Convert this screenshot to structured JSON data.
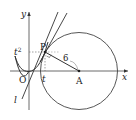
{
  "diagram": {
    "axes": {
      "x_label": "x",
      "y_label": "y",
      "origin_label": "O"
    },
    "points": {
      "P": "P",
      "A": "A"
    },
    "labels": {
      "t_squared": "t",
      "t_squared_exp": "2",
      "t": "t",
      "radius": "6",
      "line": "l"
    },
    "colors": {
      "stroke": "#333333",
      "dashed": "#666666",
      "background": "#ffffff"
    }
  }
}
